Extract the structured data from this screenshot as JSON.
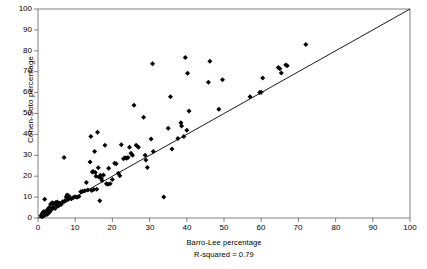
{
  "chart_data": {
    "type": "scatter",
    "title": "",
    "xlabel": "Barro-Lee percentage",
    "ylabel": "Cohen-Soto percentage",
    "annotation": "R-squared = 0.79",
    "xlim": [
      0,
      100
    ],
    "ylim": [
      0,
      100
    ],
    "xticks": [
      "0",
      "10",
      "20",
      "30",
      "40",
      "50",
      "60",
      "70",
      "80",
      "90",
      "100"
    ],
    "yticks": [
      "0",
      "10",
      "20",
      "30",
      "40",
      "50",
      "60",
      "70",
      "80",
      "90",
      "100"
    ],
    "grid": false,
    "legend": "none",
    "marker": "diamond",
    "marker_color": "#000000",
    "reference_line": {
      "label": "45-degree line",
      "from": [
        0,
        0
      ],
      "to": [
        100,
        100
      ],
      "color": "#000000"
    },
    "points": [
      [
        0.8,
        1.2
      ],
      [
        1.0,
        0.6
      ],
      [
        1.2,
        2.0
      ],
      [
        1.3,
        2.6
      ],
      [
        1.5,
        1.0
      ],
      [
        1.6,
        3.1
      ],
      [
        1.8,
        2.2
      ],
      [
        1.8,
        9.0
      ],
      [
        2.0,
        1.4
      ],
      [
        2.1,
        2.8
      ],
      [
        2.3,
        3.4
      ],
      [
        2.5,
        1.8
      ],
      [
        2.6,
        4.2
      ],
      [
        2.8,
        2.4
      ],
      [
        3.0,
        5.0
      ],
      [
        3.2,
        3.0
      ],
      [
        3.4,
        6.6
      ],
      [
        3.6,
        4.0
      ],
      [
        3.8,
        7.3
      ],
      [
        4.0,
        5.2
      ],
      [
        4.2,
        6.8
      ],
      [
        4.4,
        7.1
      ],
      [
        4.6,
        4.6
      ],
      [
        4.8,
        7.4
      ],
      [
        5.0,
        6.0
      ],
      [
        5.2,
        7.6
      ],
      [
        5.5,
        5.8
      ],
      [
        5.8,
        7.0
      ],
      [
        6.2,
        6.4
      ],
      [
        6.6,
        7.8
      ],
      [
        7.0,
        29.0
      ],
      [
        7.2,
        8.2
      ],
      [
        7.6,
        10.0
      ],
      [
        7.8,
        11.0
      ],
      [
        8.0,
        9.0
      ],
      [
        8.2,
        10.6
      ],
      [
        8.6,
        9.6
      ],
      [
        9.0,
        9.2
      ],
      [
        9.5,
        9.8
      ],
      [
        10.0,
        10.2
      ],
      [
        10.5,
        9.9
      ],
      [
        11.0,
        10.3
      ],
      [
        11.5,
        12.6
      ],
      [
        12.0,
        12.8
      ],
      [
        12.6,
        13.0
      ],
      [
        13.0,
        17.0
      ],
      [
        13.4,
        13.4
      ],
      [
        14.0,
        26.8
      ],
      [
        14.2,
        39.0
      ],
      [
        14.4,
        13.2
      ],
      [
        14.6,
        22.0
      ],
      [
        14.8,
        22.2
      ],
      [
        15.0,
        13.6
      ],
      [
        15.2,
        31.8
      ],
      [
        15.4,
        21.8
      ],
      [
        15.6,
        20.0
      ],
      [
        15.8,
        13.8
      ],
      [
        16.0,
        41.0
      ],
      [
        16.2,
        24.0
      ],
      [
        16.4,
        19.6
      ],
      [
        16.6,
        8.2
      ],
      [
        16.8,
        20.4
      ],
      [
        17.0,
        19.0
      ],
      [
        17.2,
        18.0
      ],
      [
        17.6,
        20.6
      ],
      [
        18.0,
        34.8
      ],
      [
        18.4,
        16.4
      ],
      [
        18.8,
        16.2
      ],
      [
        19.0,
        23.8
      ],
      [
        19.4,
        16.4
      ],
      [
        20.0,
        18.4
      ],
      [
        20.6,
        26.2
      ],
      [
        21.0,
        26.0
      ],
      [
        21.6,
        21.4
      ],
      [
        22.0,
        20.2
      ],
      [
        22.4,
        35.0
      ],
      [
        23.0,
        28.4
      ],
      [
        23.4,
        28.8
      ],
      [
        23.8,
        28.6
      ],
      [
        24.2,
        29.0
      ],
      [
        24.6,
        33.8
      ],
      [
        25.0,
        31.0
      ],
      [
        25.4,
        30.0
      ],
      [
        25.8,
        54.0
      ],
      [
        26.4,
        34.8
      ],
      [
        27.0,
        33.8
      ],
      [
        28.4,
        48.2
      ],
      [
        28.8,
        30.0
      ],
      [
        29.0,
        27.8
      ],
      [
        29.4,
        24.2
      ],
      [
        30.4,
        37.8
      ],
      [
        30.8,
        73.8
      ],
      [
        31.0,
        31.8
      ],
      [
        33.8,
        10.0
      ],
      [
        35.0,
        43.0
      ],
      [
        35.6,
        58.0
      ],
      [
        36.0,
        33.0
      ],
      [
        37.6,
        38.0
      ],
      [
        38.4,
        45.6
      ],
      [
        38.6,
        44.0
      ],
      [
        39.2,
        39.0
      ],
      [
        39.6,
        76.8
      ],
      [
        40.0,
        42.0
      ],
      [
        40.2,
        69.2
      ],
      [
        40.6,
        51.2
      ],
      [
        45.8,
        65.0
      ],
      [
        46.2,
        75.0
      ],
      [
        48.6,
        52.0
      ],
      [
        49.6,
        66.2
      ],
      [
        57.0,
        58.0
      ],
      [
        59.6,
        60.0
      ],
      [
        60.0,
        60.2
      ],
      [
        60.4,
        67.0
      ],
      [
        64.6,
        72.0
      ],
      [
        65.0,
        71.4
      ],
      [
        65.4,
        69.4
      ],
      [
        66.6,
        73.2
      ],
      [
        67.0,
        72.8
      ],
      [
        72.0,
        83.0
      ]
    ]
  }
}
